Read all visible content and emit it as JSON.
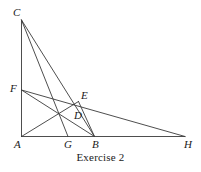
{
  "figure": {
    "caption": "Exercise 2",
    "stroke_color": "#3a3a3a",
    "label_color": "#1a1a1a",
    "background": "#ffffff",
    "points": [
      {
        "id": "C",
        "label": "C",
        "x": 21.5,
        "y": 20.0,
        "label_x": 13,
        "label_y": 7
      },
      {
        "id": "F",
        "label": "F",
        "x": 21.5,
        "y": 90.0,
        "label_x": 10,
        "label_y": 83
      },
      {
        "id": "A",
        "label": "A",
        "x": 21.5,
        "y": 136.5,
        "label_x": 14,
        "label_y": 139
      },
      {
        "id": "G",
        "label": "G",
        "x": 68.0,
        "y": 136.5,
        "label_x": 64,
        "label_y": 139
      },
      {
        "id": "B",
        "label": "B",
        "x": 94.5,
        "y": 136.5,
        "label_x": 92,
        "label_y": 139
      },
      {
        "id": "H",
        "label": "H",
        "x": 185.0,
        "y": 136.5,
        "label_x": 184,
        "label_y": 139
      },
      {
        "id": "E",
        "label": "E",
        "x": 78.5,
        "y": 101.5,
        "label_x": 81,
        "label_y": 90
      },
      {
        "id": "D",
        "label": "D",
        "x": 71.5,
        "y": 110.5,
        "label_x": 74,
        "label_y": 110
      }
    ],
    "segments": [
      {
        "id": "seg-CA",
        "from": "C",
        "to": "A",
        "name": "segment-C-A"
      },
      {
        "id": "seg-AH",
        "from": "A",
        "to": "H",
        "name": "segment-A-H"
      },
      {
        "id": "seg-CB",
        "from": "C",
        "to": "B",
        "name": "segment-C-B"
      },
      {
        "id": "seg-CG",
        "from": "C",
        "to": "G",
        "name": "segment-C-G"
      },
      {
        "id": "seg-FH",
        "from": "F",
        "to": "H",
        "name": "segment-F-H"
      },
      {
        "id": "seg-FB",
        "from": "F",
        "to": "B",
        "name": "segment-F-B"
      },
      {
        "id": "seg-AE",
        "from": "A",
        "to": "E",
        "name": "segment-A-E"
      },
      {
        "id": "seg-EB",
        "from": "E",
        "to": "B",
        "name": "segment-E-B"
      }
    ]
  }
}
